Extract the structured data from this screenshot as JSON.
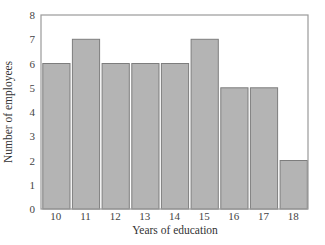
{
  "chart_data": {
    "type": "bar",
    "title": "",
    "xlabel": "Years of education",
    "ylabel": "Number of employees",
    "categories": [
      "10",
      "11",
      "12",
      "13",
      "14",
      "15",
      "16",
      "17",
      "18"
    ],
    "values": [
      6,
      7,
      6,
      6,
      6,
      7,
      5,
      5,
      2
    ],
    "ylim": [
      0,
      8
    ],
    "yticks": [
      0,
      1,
      2,
      3,
      4,
      5,
      6,
      7,
      8
    ],
    "grid": false,
    "legend": null,
    "colors": {
      "bar_fill": "#b4b4b4",
      "bar_edge": "#7d7d7d",
      "frame": "#9a9a9a"
    }
  }
}
